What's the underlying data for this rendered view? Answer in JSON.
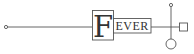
{
  "diagram": {
    "type": "rune-glyph",
    "initial_letter": "F",
    "rest_letters": "EVER",
    "colors": {
      "stroke": "#555555",
      "text": "#333333",
      "background": "#ffffff"
    },
    "shapes": [
      {
        "kind": "start-dot",
        "cx": 6,
        "cy": 27
      },
      {
        "kind": "main-line",
        "from_x": 7,
        "to_x": 179,
        "y": 27
      },
      {
        "kind": "initial-box",
        "x": 92,
        "y": 10,
        "w": 21,
        "h": 30
      },
      {
        "kind": "word-box",
        "x": 113,
        "y": 18,
        "w": 38,
        "h": 15
      },
      {
        "kind": "vertical-stem",
        "x": 171,
        "from_y": 6,
        "to_y": 39
      },
      {
        "kind": "top-dot",
        "cx": 171,
        "cy": 5
      },
      {
        "kind": "end-square",
        "x": 179,
        "y": 23,
        "w": 8,
        "h": 8
      },
      {
        "kind": "bottom-ring",
        "cx": 171,
        "cy": 44,
        "r": 5
      }
    ]
  }
}
